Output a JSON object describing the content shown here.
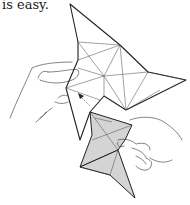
{
  "caption": {
    "text": "is easy."
  },
  "illustration": {
    "subject": "origami-folding-hands",
    "description": "Hands holding a folded paper star shape, with a shaded flap being folded in; arrow indicates folding direction",
    "colors": {
      "line": "#222222",
      "shade": "#d4d4d4",
      "background": "#ffffff"
    }
  }
}
